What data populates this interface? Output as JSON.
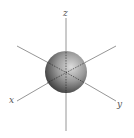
{
  "diagram": {
    "type": "s-orbital",
    "axes": {
      "z_label": "z",
      "x_label": "x",
      "y_label": "y"
    },
    "colors": {
      "axis_line": "#8a8a8a",
      "sphere_highlight": "#d8d8d8",
      "sphere_mid": "#8c8c8c",
      "sphere_shadow": "#2e2e2e",
      "label": "#555555"
    }
  }
}
